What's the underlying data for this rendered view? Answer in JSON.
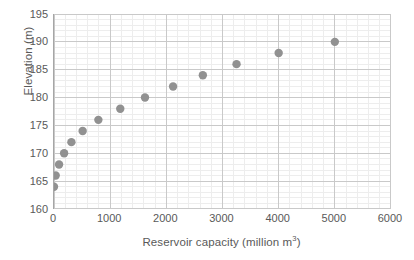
{
  "chart_data": {
    "type": "scatter",
    "title": "",
    "xlabel": "Reservoir capacity (million m³)",
    "xlabel_base": "Reservoir capacity (million m",
    "xlabel_sup": "3",
    "xlabel_tail": ")",
    "ylabel": "Elevation (m)",
    "xlim": [
      0,
      6000
    ],
    "ylim": [
      160,
      195
    ],
    "x_major_ticks": [
      0,
      1000,
      2000,
      3000,
      4000,
      5000,
      6000
    ],
    "x_tick_labels": [
      "0",
      "1000",
      "2000",
      "3000",
      "4000",
      "5000",
      "6000"
    ],
    "x_minor_step": 200,
    "y_major_ticks": [
      160,
      165,
      170,
      175,
      180,
      185,
      190,
      195
    ],
    "y_tick_labels": [
      "160",
      "165",
      "170",
      "175",
      "180",
      "185",
      "190",
      "195"
    ],
    "y_minor_step": 1,
    "grid": true,
    "grid_major_color": "#c9c9c9",
    "grid_minor_color": "#ededed",
    "axis_color": "#a6a6a6",
    "legend": "none",
    "marker": {
      "shape": "circle",
      "color": "#919191",
      "radius_px": 4.2
    },
    "series": [
      {
        "name": "Elevation vs reservoir capacity",
        "points": [
          {
            "x": 0,
            "y": 164
          },
          {
            "x": 30,
            "y": 166
          },
          {
            "x": 90,
            "y": 168
          },
          {
            "x": 180,
            "y": 170
          },
          {
            "x": 310,
            "y": 172
          },
          {
            "x": 510,
            "y": 174
          },
          {
            "x": 790,
            "y": 176
          },
          {
            "x": 1180,
            "y": 178
          },
          {
            "x": 1620,
            "y": 180
          },
          {
            "x": 2120,
            "y": 182
          },
          {
            "x": 2650,
            "y": 184
          },
          {
            "x": 3250,
            "y": 186
          },
          {
            "x": 4000,
            "y": 188
          },
          {
            "x": 5000,
            "y": 190
          }
        ]
      }
    ]
  }
}
